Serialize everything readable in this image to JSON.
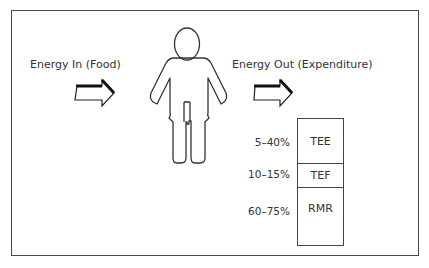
{
  "diagram": {
    "energy_in_label": "Energy In (Food)",
    "energy_out_label": "Energy Out (Expenditure)",
    "components": [
      {
        "name": "TEE",
        "percent": "5–40%"
      },
      {
        "name": "TEF",
        "percent": "10–15%"
      },
      {
        "name": "RMR",
        "percent": "60–75%"
      }
    ],
    "icons": {
      "energy_in_arrow": "right-arrow-icon",
      "energy_out_arrow": "right-arrow-icon",
      "figure": "human-figure-icon"
    },
    "colors": {
      "stroke": "#333333",
      "background": "#ffffff"
    }
  }
}
